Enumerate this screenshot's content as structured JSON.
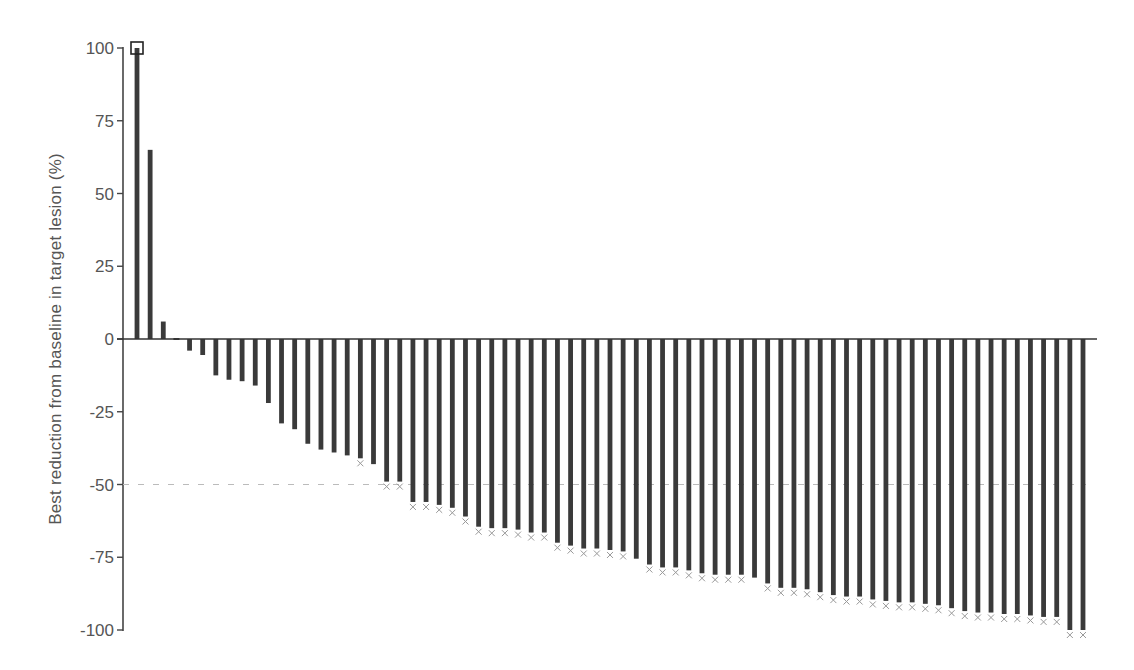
{
  "chart_data": {
    "type": "bar",
    "title": "",
    "xlabel": "",
    "ylabel": "Best reduction from baseline in target lesion (%)",
    "ylim": [
      -100,
      100
    ],
    "yticks": [
      100,
      75,
      50,
      25,
      0,
      -25,
      -50,
      -75,
      -100
    ],
    "ytick_labels": [
      "100",
      "75",
      "50",
      "25",
      "0",
      "-25",
      "-50",
      "-75",
      "-100"
    ],
    "grid": false,
    "legend": null,
    "reference_lines": [
      {
        "y": 0,
        "style": "solid",
        "color": "#333333"
      },
      {
        "y": -50,
        "style": "dashed",
        "color": "#bbbbbb"
      }
    ],
    "bar_color": "#3a3a3a",
    "categories": [
      "P1",
      "P2",
      "P3",
      "P4",
      "P5",
      "P6",
      "P7",
      "P8",
      "P9",
      "P10",
      "P11",
      "P12",
      "P13",
      "P14",
      "P15",
      "P16",
      "P17",
      "P18",
      "P19",
      "P20",
      "P21",
      "P22",
      "P23",
      "P24",
      "P25",
      "P26",
      "P27",
      "P28",
      "P29",
      "P30",
      "P31",
      "P32",
      "P33",
      "P34",
      "P35",
      "P36",
      "P37",
      "P38",
      "P39",
      "P40",
      "P41",
      "P42",
      "P43",
      "P44",
      "P45",
      "P46",
      "P47",
      "P48",
      "P49",
      "P50",
      "P51",
      "P52",
      "P53",
      "P54",
      "P55",
      "P56",
      "P57",
      "P58",
      "P59",
      "P60",
      "P61",
      "P62",
      "P63",
      "P64",
      "P65",
      "P66",
      "P67",
      "P68",
      "P69",
      "P70",
      "P71",
      "P72",
      "P73"
    ],
    "values": [
      100,
      65,
      6,
      0,
      -4,
      -5.5,
      -12.5,
      -14,
      -14.5,
      -16,
      -22,
      -29,
      -31,
      -36,
      -38,
      -39,
      -40,
      -41,
      -43,
      -49,
      -49,
      -56,
      -56,
      -57,
      -58,
      -61,
      -64.5,
      -65,
      -65,
      -65.5,
      -66.5,
      -66.5,
      -70,
      -71,
      -72,
      -72,
      -72.5,
      -73,
      -75.5,
      -77.5,
      -78.5,
      -78.5,
      -79.5,
      -80.5,
      -81,
      -81,
      -81,
      -82,
      -84,
      -85.5,
      -85.5,
      -86,
      -87,
      -88,
      -88.5,
      -88.5,
      -89.5,
      -90,
      -90.5,
      -90.5,
      -91,
      -91.5,
      -92.5,
      -93.5,
      -94,
      -94,
      -94.5,
      -94.5,
      -95,
      -95.5,
      -95.5,
      -100,
      -100
    ],
    "markers": {
      "square": [
        0
      ],
      "cross": [
        17,
        19,
        20,
        21,
        22,
        23,
        24,
        25,
        26,
        27,
        28,
        29,
        30,
        31,
        32,
        33,
        34,
        35,
        36,
        37,
        39,
        40,
        41,
        42,
        43,
        44,
        45,
        46,
        48,
        49,
        50,
        51,
        52,
        53,
        54,
        55,
        56,
        57,
        58,
        59,
        60,
        61,
        62,
        63,
        64,
        65,
        66,
        67,
        68,
        69,
        70,
        71,
        72
      ]
    }
  }
}
